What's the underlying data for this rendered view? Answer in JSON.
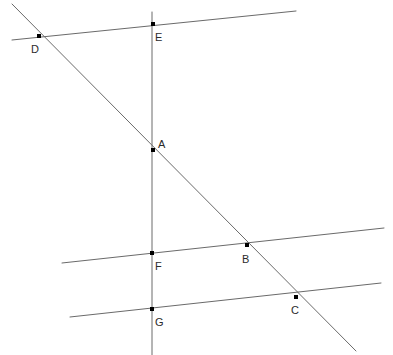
{
  "figure": {
    "type": "geometry-diagram",
    "width": 393,
    "height": 355,
    "background_color": "#ffffff",
    "line_color": "#6a6a6a",
    "point_color": "#000000",
    "label_color": "#2b2b2b",
    "line_width": 1,
    "point_size": 4,
    "label_font_size": 11
  },
  "lines": [
    {
      "id": "top-line",
      "name": "top-transversal-line",
      "x1": 12,
      "y1": 40,
      "x2": 296,
      "y2": 11
    },
    {
      "id": "middle-line",
      "name": "middle-transversal-line",
      "x1": 62,
      "y1": 263,
      "x2": 384,
      "y2": 228
    },
    {
      "id": "bottom-line",
      "name": "bottom-transversal-line",
      "x1": 70,
      "y1": 317,
      "x2": 381,
      "y2": 283
    },
    {
      "id": "vertical-line",
      "name": "vertical-line",
      "x1": 152,
      "y1": 12,
      "x2": 152,
      "y2": 355
    },
    {
      "id": "diagonal-line",
      "name": "diagonal-line",
      "x1": 12,
      "y1": 4,
      "x2": 356,
      "y2": 351
    }
  ],
  "points": [
    {
      "id": "A",
      "label": "A",
      "x": 153,
      "y": 150,
      "label_x": 158,
      "label_y": 148
    },
    {
      "id": "B",
      "label": "B",
      "x": 247,
      "y": 245,
      "label_x": 242,
      "label_y": 263
    },
    {
      "id": "C",
      "label": "C",
      "x": 296,
      "y": 297,
      "label_x": 291,
      "label_y": 314
    },
    {
      "id": "D",
      "label": "D",
      "x": 39,
      "y": 36,
      "label_x": 31,
      "label_y": 53
    },
    {
      "id": "E",
      "label": "E",
      "x": 153,
      "y": 24,
      "label_x": 155,
      "label_y": 41
    },
    {
      "id": "F",
      "label": "F",
      "x": 152,
      "y": 253,
      "label_x": 155,
      "label_y": 270
    },
    {
      "id": "G",
      "label": "G",
      "x": 152,
      "y": 309,
      "label_x": 155,
      "label_y": 326
    }
  ]
}
